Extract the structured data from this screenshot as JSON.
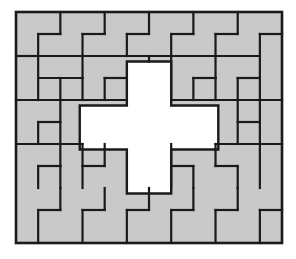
{
  "figure": {
    "type": "tiling-diagram",
    "caption": "",
    "canvas": {
      "width": 296,
      "height": 259,
      "background": "#ffffff"
    }
  },
  "style": {
    "piece_fill": "#c9c9c9",
    "piece_stroke": "#1a1a1a",
    "piece_stroke_width": 2.2,
    "frame_stroke": "#1a1a1a",
    "frame_stroke_width": 2.6,
    "hole_fill": "#ffffff"
  },
  "geometry": {
    "rect_x": 16,
    "rect_y": 12,
    "rect_width": 266,
    "rect_height": 231,
    "grid_cols": 12,
    "grid_rows": 10.5,
    "cell_size": 22.17,
    "half_cell": 11.08,
    "hole_shape": "plus-cross",
    "hole_vertical_bar": {
      "x0": 5,
      "x1": 7,
      "y0": 2.25,
      "y1": 8.25
    },
    "hole_horizontal_bar": {
      "x0": 2.875,
      "x1": 9.125,
      "y0": 4.25,
      "y1": 6.25
    }
  },
  "pieces": [
    {
      "id": "p01",
      "shape": "L",
      "cells": "0,0 2,0 2,1 1,1 1,2 0,2",
      "region": "top-left"
    },
    {
      "id": "p02",
      "shape": "S",
      "cells": "2,0 4,0 4,1 3,1 3,2 2,2",
      "region": "top-left"
    },
    {
      "id": "p03",
      "shape": "L",
      "cells": "4,0 6,0 6,1 5,1 5,2 4,2",
      "region": "top-center"
    },
    {
      "id": "p04",
      "shape": "T",
      "cells": "6,0 8,0 8,1 7,1 7,2 6,2",
      "region": "top-center"
    },
    {
      "id": "p05",
      "shape": "L",
      "cells": "8,0 10,0 10,1 9,1 9,2 8,2",
      "region": "top-right"
    },
    {
      "id": "p06",
      "shape": "L",
      "cells": "10,0 12,0 12,2 11,2 11,1 10,1",
      "region": "top-right-corner"
    },
    {
      "id": "p07",
      "shape": "L",
      "cells": "0,2 1,2 1,4 0,4",
      "region": "left-upper"
    },
    {
      "id": "p08",
      "shape": "L",
      "cells": "1,2 3,2 3,3 2,3 2,4 1,4",
      "region": "left-upper"
    },
    {
      "id": "p09",
      "shape": "L",
      "cells": "3,2 5,2 5,4 4,4 4,3 3,3",
      "region": "center-upper-left"
    },
    {
      "id": "p10",
      "shape": "L",
      "cells": "7,2 9,2 9,3 8,3 8,4 7,4",
      "region": "center-upper-right"
    },
    {
      "id": "p11",
      "shape": "L",
      "cells": "9,2 11,2 11,3 10,3 10,4 9,4",
      "region": "right-upper"
    },
    {
      "id": "p12",
      "shape": "I",
      "cells": "11,2 12,2 12,4 11,4",
      "region": "right-edge"
    },
    {
      "id": "p13",
      "shape": "L",
      "cells": "0,4 2,4 2,5 1,5 1,6 0,6",
      "region": "left-middle"
    },
    {
      "id": "p14",
      "shape": "L",
      "cells": "2,4 3,4 3,6 2,6",
      "region": "left-middle"
    },
    {
      "id": "p15",
      "shape": "L",
      "cells": "9,4 11,4 11,6 10,6 10,5 9,5",
      "region": "right-middle"
    },
    {
      "id": "p16",
      "shape": "I",
      "cells": "11,4 12,4 12,6 11,6",
      "region": "right-edge"
    },
    {
      "id": "p17",
      "shape": "L",
      "cells": "0,6 2,6 2,7 1,7 1,8 0,8",
      "region": "left-lower"
    },
    {
      "id": "p18",
      "shape": "L",
      "cells": "2,6 4,6 4,8 3,8 3,7 2,7",
      "region": "left-lower"
    },
    {
      "id": "p19",
      "shape": "L",
      "cells": "5,6 7,6 7,8 6,8 6,7 5,7",
      "region": "center-lower"
    },
    {
      "id": "p20",
      "shape": "L",
      "cells": "7,6 9,6 9,7 8,7 8,8 7,8",
      "region": "center-lower-right"
    },
    {
      "id": "p21",
      "shape": "L",
      "cells": "9,6 11,6 11,8 10,8 10,7 9,7",
      "region": "right-lower"
    },
    {
      "id": "p22",
      "shape": "I",
      "cells": "11,6 12,6 12,8 11,8",
      "region": "right-edge"
    },
    {
      "id": "p23",
      "shape": "L",
      "cells": "0,8 2,8 2,9 1,9 1,10 0,10",
      "region": "bottom-left"
    },
    {
      "id": "p24",
      "shape": "L",
      "cells": "2,8 4,8 4,10 3,10 3,9 2,9",
      "region": "bottom-left"
    },
    {
      "id": "p25",
      "shape": "T",
      "cells": "4,8 6,8 6,10 5,10 5,9 4,9",
      "region": "bottom-center"
    },
    {
      "id": "p26",
      "shape": "L",
      "cells": "6,8 8,8 8,9 7,9 7,10 6,10",
      "region": "bottom-center"
    },
    {
      "id": "p27",
      "shape": "L",
      "cells": "8,8 10,8 10,10 9,10 9,9 8,9",
      "region": "bottom-right"
    },
    {
      "id": "p28",
      "shape": "L",
      "cells": "10,8 12,8 12,10 11,10 11,9 10,9",
      "region": "bottom-right-corner"
    }
  ],
  "labels": {
    "outer_frame": "puzzle-border",
    "hole": "central-cross-hole"
  }
}
